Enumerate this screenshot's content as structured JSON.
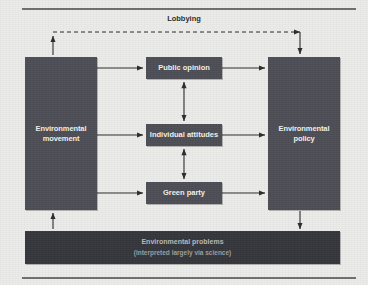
{
  "diagram": {
    "title_label": "Lobbying",
    "nodes": {
      "movement": {
        "label": "Environmental\nmovement",
        "line1": "Environmental",
        "line2": "movement"
      },
      "policy": {
        "label": "Environmental\npolicy",
        "line1": "Environmental",
        "line2": "policy"
      },
      "public_opinion": {
        "label": "Public opinion"
      },
      "individual_attitudes": {
        "label": "Individual attitudes"
      },
      "green_party": {
        "label": "Green party"
      },
      "problems": {
        "line1": "Environmental problems",
        "line2": "(interpreted largely via science)"
      }
    },
    "edges": [
      {
        "from": "movement",
        "to": "public_opinion",
        "style": "solid",
        "arrow": "single"
      },
      {
        "from": "movement",
        "to": "individual_attitudes",
        "style": "solid",
        "arrow": "single"
      },
      {
        "from": "movement",
        "to": "green_party",
        "style": "solid",
        "arrow": "single"
      },
      {
        "from": "public_opinion",
        "to": "policy",
        "style": "solid",
        "arrow": "single"
      },
      {
        "from": "individual_attitudes",
        "to": "policy",
        "style": "solid",
        "arrow": "single"
      },
      {
        "from": "green_party",
        "to": "policy",
        "style": "solid",
        "arrow": "single"
      },
      {
        "from": "public_opinion",
        "to": "individual_attitudes",
        "style": "solid",
        "arrow": "double"
      },
      {
        "from": "individual_attitudes",
        "to": "green_party",
        "style": "solid",
        "arrow": "double"
      },
      {
        "from": "movement",
        "to": "policy",
        "style": "dashed",
        "arrow": "single",
        "label": "Lobbying"
      },
      {
        "from": "problems",
        "to": "movement",
        "style": "solid",
        "arrow": "single"
      },
      {
        "from": "policy",
        "to": "problems",
        "style": "solid",
        "arrow": "single"
      }
    ],
    "colors": {
      "background": "#ececeb",
      "node_fill": "#4d4d55",
      "node_text": "#f2f2ee",
      "problems_fill": "#35353c",
      "rule": "#6f6f70",
      "wire": "#2b2b2b"
    }
  }
}
